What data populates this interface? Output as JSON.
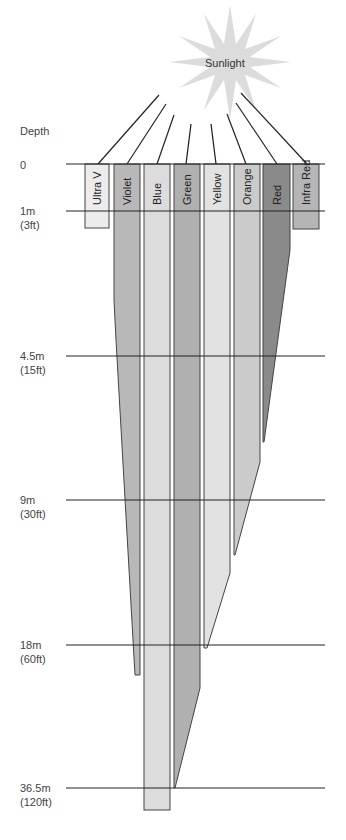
{
  "sun": {
    "label": "Sunlight",
    "color": "#dcdcdc",
    "cx": 230,
    "cy": 62
  },
  "depth_title": "Depth",
  "depth_lines": [
    {
      "m": "0",
      "ft": "",
      "y": 164
    },
    {
      "m": "1m",
      "ft": "(3ft)",
      "y": 211
    },
    {
      "m": "4.5m",
      "ft": "(15ft)",
      "y": 356
    },
    {
      "m": "9m",
      "ft": "(30ft)",
      "y": 500
    },
    {
      "m": "18m",
      "ft": "(60ft)",
      "y": 645
    },
    {
      "m": "36.5m",
      "ft": "(120ft)",
      "y": 788
    }
  ],
  "bands": [
    {
      "name": "Ultra V",
      "color": "#ececec",
      "x": 85,
      "w": 24,
      "penetration": "<1m"
    },
    {
      "name": "Violet",
      "color": "#b8b8b8",
      "x": 114,
      "w": 26,
      "penetration": "~20m"
    },
    {
      "name": "Blue",
      "color": "#dcdcdc",
      "x": 144,
      "w": 26,
      "penetration": ">36.5m"
    },
    {
      "name": "Green",
      "color": "#b0b0b0",
      "x": 174,
      "w": 26,
      "penetration": "~36.5m"
    },
    {
      "name": "Yellow",
      "color": "#e2e2e2",
      "x": 204,
      "w": 26,
      "penetration": "~30m"
    },
    {
      "name": "Orange",
      "color": "#cbcbcb",
      "x": 234,
      "w": 26,
      "penetration": "~15m"
    },
    {
      "name": "Red",
      "color": "#8a8a8a",
      "x": 263,
      "w": 27,
      "penetration": "~7.5m"
    },
    {
      "name": "Infra Red",
      "color": "#b5b5b5",
      "x": 293,
      "w": 26,
      "penetration": "<1m"
    }
  ]
}
